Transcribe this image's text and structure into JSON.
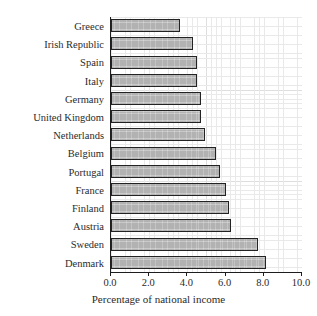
{
  "chart_data": {
    "type": "bar",
    "orientation": "horizontal",
    "title": "",
    "xlabel": "Percentage of national income",
    "ylabel": "",
    "xlim": [
      0.0,
      10.0
    ],
    "xticks": [
      "0.0",
      "2.0",
      "4.0",
      "6.0",
      "8.0",
      "10.0"
    ],
    "xtick_values": [
      0.0,
      2.0,
      4.0,
      6.0,
      8.0,
      10.0
    ],
    "grid": true,
    "legend": false,
    "categories": [
      "Greece",
      "Irish Republic",
      "Spain",
      "Italy",
      "Germany",
      "United Kingdom",
      "Netherlands",
      "Belgium",
      "Portugal",
      "France",
      "Finland",
      "Austria",
      "Sweden",
      "Denmark"
    ],
    "values": [
      3.6,
      4.3,
      4.5,
      4.5,
      4.7,
      4.7,
      4.9,
      5.5,
      5.7,
      6.0,
      6.2,
      6.3,
      7.7,
      8.1
    ],
    "bar_fill_color": "#b2b2b2",
    "bar_edge_color": "#232323",
    "axis_color": "#1d1d1d",
    "grid_color": "#e2e2e2",
    "background_color": "#ffffff"
  }
}
